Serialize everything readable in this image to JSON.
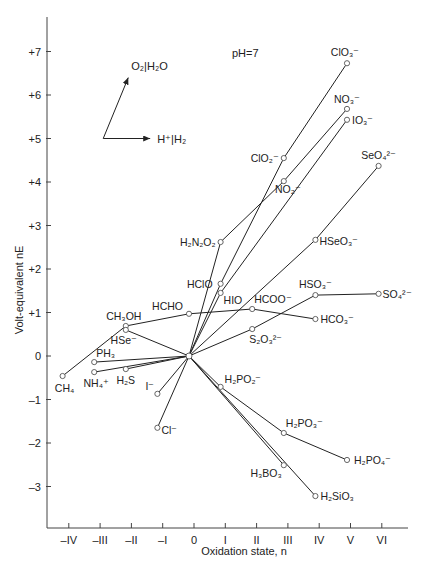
{
  "chart_data": {
    "type": "line",
    "title": "",
    "annotation": "pH=7",
    "xlabel": "Oxidation state, n",
    "ylabel": "Volt-equivalent nE",
    "xlim": [
      -4.5,
      6.4
    ],
    "ylim": [
      -3.9,
      7.4
    ],
    "x_ticks": [
      -4,
      -3,
      -2,
      -1,
      0,
      1,
      2,
      3,
      4,
      5,
      6
    ],
    "x_tick_labels": [
      "–IV",
      "–III",
      "–II",
      "–I",
      "0",
      "I",
      "II",
      "III",
      "IV",
      "V",
      "VI"
    ],
    "y_ticks": [
      7,
      6,
      5,
      4,
      3,
      2,
      1,
      0,
      -1,
      -2,
      -3
    ],
    "y_tick_labels": [
      "+7",
      "+6",
      "+5",
      "+4",
      "+3",
      "+2",
      "+1",
      "0",
      "–1",
      "–2",
      "–3"
    ],
    "grid": false,
    "reference_arrows": [
      {
        "label": "O₂|H₂O",
        "from": [
          -2.9,
          5.0
        ],
        "to": [
          -2.1,
          6.4
        ]
      },
      {
        "label": "H⁺|H₂",
        "from": [
          -2.9,
          5.0
        ],
        "to": [
          -1.4,
          5.0
        ]
      }
    ],
    "points": {
      "hub": [
        0,
        0
      ],
      "ClO3-": [
        5,
        6.73
      ],
      "NO3-": [
        5,
        5.68
      ],
      "IO3-": [
        5,
        5.43
      ],
      "ClO2-": [
        3,
        4.55
      ],
      "NO2-": [
        3,
        4.02
      ],
      "SeO4 2-": [
        6,
        4.37
      ],
      "H2N2O2": [
        1,
        2.62
      ],
      "HSeO3-": [
        4,
        2.67
      ],
      "HClO": [
        1,
        1.66
      ],
      "HIO": [
        1,
        1.45
      ],
      "HSO3-": [
        4,
        1.4
      ],
      "SO4 2-": [
        6,
        1.43
      ],
      "HCOO-": [
        2,
        1.08
      ],
      "HCO3-": [
        4,
        0.85
      ],
      "S2O3 2-": [
        2,
        0.62
      ],
      "HCHO": [
        0,
        0.97
      ],
      "CH3OH": [
        -2,
        0.69
      ],
      "HSe-": [
        -2,
        0.6
      ],
      "PH3": [
        -3,
        -0.14
      ],
      "NH4+": [
        -3,
        -0.37
      ],
      "H2S": [
        -2,
        -0.3
      ],
      "CH4": [
        -4,
        -0.46
      ],
      "I-": [
        -1,
        -0.87
      ],
      "Cl-": [
        -1,
        -1.65
      ],
      "H2PO2-": [
        1,
        -0.71
      ],
      "H2PO3-": [
        3,
        -1.77
      ],
      "H2PO4-": [
        5,
        -2.39
      ],
      "H3BO3": [
        3,
        -2.51
      ],
      "H2SiO3": [
        4,
        -3.22
      ]
    },
    "series": [
      {
        "name": "Chlorine",
        "path": [
          "Cl-",
          "hub",
          "HClO",
          "ClO2-",
          "ClO3-"
        ]
      },
      {
        "name": "Nitrogen",
        "path": [
          "NH4+",
          "hub",
          "H2N2O2",
          "NO2-",
          "NO3-"
        ]
      },
      {
        "name": "Iodine",
        "path": [
          "I-",
          "hub",
          "HIO",
          "IO3-"
        ]
      },
      {
        "name": "Sulfur",
        "path": [
          "H2S",
          "hub",
          "S2O3 2-",
          "HSO3-",
          "SO4 2-"
        ]
      },
      {
        "name": "Selenium",
        "path": [
          "HSe-",
          "hub",
          "HSeO3-",
          "SeO4 2-"
        ]
      },
      {
        "name": "Carbon",
        "path": [
          "CH4",
          "CH3OH",
          "HCHO",
          "HCOO-",
          "HCO3-"
        ]
      },
      {
        "name": "Phosphorus",
        "path": [
          "PH3",
          "hub",
          "H2PO2-",
          "H2PO3-",
          "H2PO4-"
        ]
      },
      {
        "name": "Boron",
        "path": [
          "hub",
          "H3BO3"
        ]
      },
      {
        "name": "Silicon",
        "path": [
          "hub",
          "H2SiO3"
        ]
      }
    ],
    "labels": [
      {
        "key": "ClO3-",
        "text": "ClO₃⁻",
        "dx": -2,
        "dy": -7,
        "anchor": "middle"
      },
      {
        "key": "NO3-",
        "text": "NO₃⁻",
        "dx": 0,
        "dy": -6,
        "anchor": "middle"
      },
      {
        "key": "IO3-",
        "text": "IO₃⁻",
        "dx": 5,
        "dy": 4,
        "anchor": "start"
      },
      {
        "key": "ClO2-",
        "text": "ClO₂⁻",
        "dx": -5,
        "dy": 4,
        "anchor": "end"
      },
      {
        "key": "NO2-",
        "text": "NO₂⁻",
        "dx": 4,
        "dy": 12,
        "anchor": "middle"
      },
      {
        "key": "SeO4 2-",
        "text": "SeO₄²⁻",
        "dx": 0,
        "dy": -7,
        "anchor": "middle"
      },
      {
        "key": "H2N2O2",
        "text": "H₂N₂O₂",
        "dx": -5,
        "dy": 4,
        "anchor": "end"
      },
      {
        "key": "HSeO3-",
        "text": "HSeO₃⁻",
        "dx": 4,
        "dy": 5,
        "anchor": "start"
      },
      {
        "key": "HClO",
        "text": "HClO",
        "dx": -8,
        "dy": 4,
        "anchor": "end"
      },
      {
        "key": "HIO",
        "text": "HIO",
        "dx": 3,
        "dy": 11,
        "anchor": "start"
      },
      {
        "key": "HSO3-",
        "text": "HSO₃⁻",
        "dx": 0,
        "dy": -7,
        "anchor": "middle"
      },
      {
        "key": "SO4 2-",
        "text": "SO₄²⁻",
        "dx": 4,
        "dy": 4,
        "anchor": "start"
      },
      {
        "key": "HCOO-",
        "text": "HCOO⁻",
        "dx": 2,
        "dy": -6,
        "anchor": "start"
      },
      {
        "key": "HCO3-",
        "text": "HCO₃⁻",
        "dx": 5,
        "dy": 4,
        "anchor": "start"
      },
      {
        "key": "S2O3 2-",
        "text": "S₂O₃²⁻",
        "dx": -3,
        "dy": 14,
        "anchor": "start"
      },
      {
        "key": "HCHO",
        "text": "HCHO",
        "dx": -6,
        "dy": -4,
        "anchor": "end"
      },
      {
        "key": "CH3OH",
        "text": "CH₃OH",
        "dx": -2,
        "dy": -6,
        "anchor": "middle"
      },
      {
        "key": "HSe-",
        "text": "HSe⁻",
        "dx": -2,
        "dy": 14,
        "anchor": "middle"
      },
      {
        "key": "PH3",
        "text": "PH₃",
        "dx": 2,
        "dy": -5,
        "anchor": "start"
      },
      {
        "key": "NH4+",
        "text": "NH₄⁺",
        "dx": 2,
        "dy": 15,
        "anchor": "middle"
      },
      {
        "key": "H2S",
        "text": "H₂S",
        "dx": 0,
        "dy": 15,
        "anchor": "middle"
      },
      {
        "key": "CH4",
        "text": "CH₄",
        "dx": 2,
        "dy": 16,
        "anchor": "middle"
      },
      {
        "key": "I-",
        "text": "I⁻",
        "dx": -3,
        "dy": -4,
        "anchor": "end"
      },
      {
        "key": "Cl-",
        "text": "Cl⁻",
        "dx": 4,
        "dy": 6,
        "anchor": "start"
      },
      {
        "key": "H2PO2-",
        "text": "H₂PO₂⁻",
        "dx": 4,
        "dy": -4,
        "anchor": "start"
      },
      {
        "key": "H2PO3-",
        "text": "H₂PO₃⁻",
        "dx": 2,
        "dy": -6,
        "anchor": "start"
      },
      {
        "key": "H2PO4-",
        "text": "H₂PO₄⁻",
        "dx": 7,
        "dy": 4,
        "anchor": "start"
      },
      {
        "key": "H3BO3",
        "text": "H₃BO₃",
        "dx": -2,
        "dy": 12,
        "anchor": "end"
      },
      {
        "key": "H2SiO3",
        "text": "H₂SiO₃",
        "dx": 5,
        "dy": 4,
        "anchor": "start"
      }
    ]
  }
}
